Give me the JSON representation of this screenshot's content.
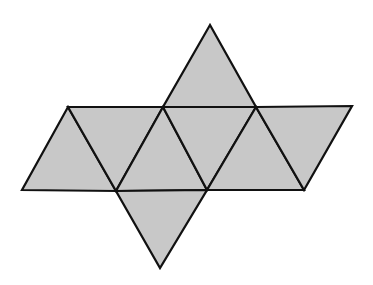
{
  "diagram": {
    "type": "net",
    "colors": {
      "fill": "#c8c8c8",
      "stroke": "#111111",
      "background": "#ffffff"
    },
    "vertices": {
      "T": [
        210,
        25
      ],
      "A1": [
        68,
        107
      ],
      "A2": [
        163,
        107
      ],
      "A3": [
        256,
        107
      ],
      "A4": [
        352,
        106
      ],
      "B1": [
        22,
        190
      ],
      "B2": [
        116,
        191
      ],
      "B3": [
        207,
        190
      ],
      "B4": [
        304,
        190
      ],
      "Bot": [
        160,
        268
      ]
    },
    "faces": [
      [
        "T",
        "A2",
        "A3"
      ],
      [
        "A1",
        "B1",
        "B2"
      ],
      [
        "A1",
        "A2",
        "B2"
      ],
      [
        "A2",
        "B2",
        "B3"
      ],
      [
        "A2",
        "A3",
        "B3"
      ],
      [
        "A3",
        "B3",
        "B4"
      ],
      [
        "A3",
        "A4",
        "B4"
      ],
      [
        "B2",
        "B3",
        "Bot"
      ]
    ]
  }
}
